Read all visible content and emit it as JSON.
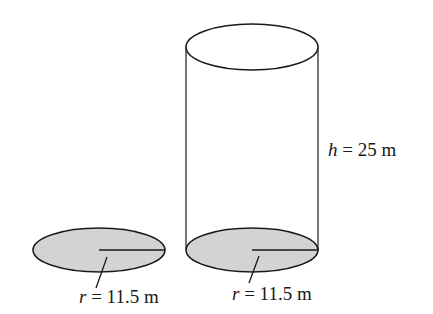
{
  "diagram": {
    "type": "geometry",
    "colors": {
      "stroke": "#1a1a1a",
      "base_fill": "#d9d9d9",
      "background": "#ffffff"
    },
    "base_circle": {
      "radius_label_var": "r",
      "radius_label_value": "= 11.5 m"
    },
    "cylinder": {
      "height_label_var": "h",
      "height_label_value": "= 25 m",
      "radius_label_var": "r",
      "radius_label_value": "= 11.5 m"
    }
  }
}
